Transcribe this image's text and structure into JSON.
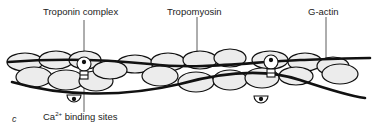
{
  "labels": {
    "troponin": "Troponin complex",
    "tropomyosin": "Tropomyosin",
    "gactin": "G-actin",
    "calcium_prefix": "Ca",
    "calcium_sup": "2+",
    "calcium_suffix": " binding sites",
    "panel": "c"
  },
  "colors": {
    "monomer_fill": "#ececec",
    "stroke": "#111111",
    "background": "#ffffff"
  }
}
